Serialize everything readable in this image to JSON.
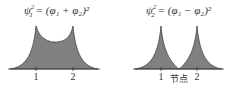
{
  "panels": [
    {
      "equation": {
        "lhs": "ψ",
        "lhs_sub": "1",
        "lhs_sup": "2",
        "rhs": "= (φ₁ + φ₂)²"
      },
      "labels": [
        "1",
        "2"
      ]
    },
    {
      "equation": {
        "lhs": "ψ",
        "lhs_sub": "2",
        "lhs_sup": "2",
        "rhs": "= (φ₁ − φ₂)²"
      },
      "labels": [
        "1",
        "节点",
        "2"
      ]
    }
  ],
  "colors": {
    "fill": "#808080",
    "stroke": "#333333"
  }
}
